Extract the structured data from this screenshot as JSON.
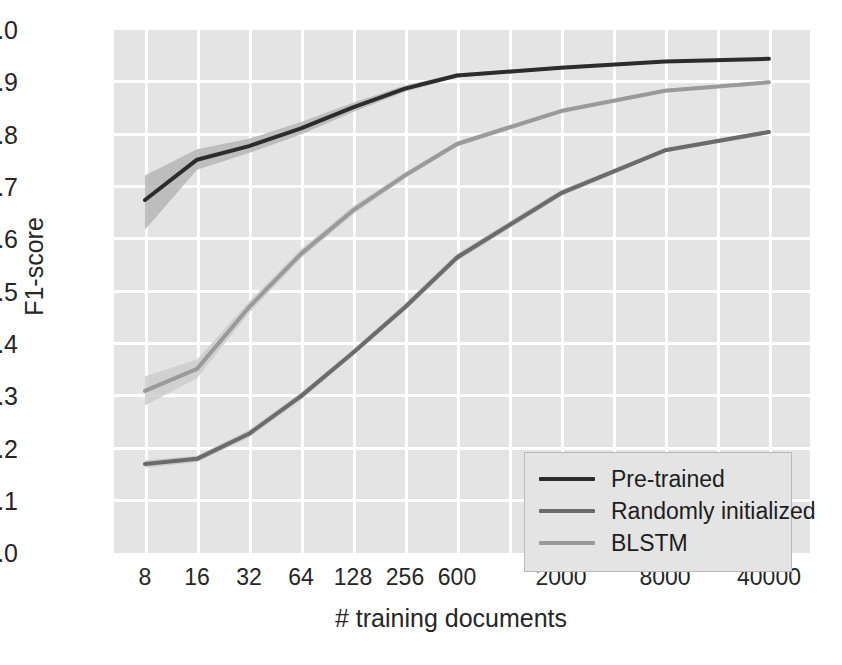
{
  "chart_data": {
    "type": "line",
    "title": "",
    "xlabel": "# training documents",
    "ylabel": "F1-score",
    "categories": [
      "8",
      "16",
      "32",
      "64",
      "128",
      "256",
      "600",
      "2000",
      "8000",
      "40000"
    ],
    "ylim": [
      0.0,
      1.0
    ],
    "yticks": [
      "1.0",
      "0.9",
      "0.8",
      "0.7",
      "0.6",
      "0.5",
      "0.4",
      "0.3",
      "0.2",
      "0.1",
      "0.0"
    ],
    "grid": true,
    "legend_position": "lower right",
    "series": [
      {
        "name": "Pre-trained",
        "color": "#2c2c2c",
        "band_color": "#b6b6b6",
        "values": [
          0.675,
          0.752,
          0.778,
          0.812,
          0.852,
          0.888,
          0.913,
          0.928,
          0.94,
          0.945
        ],
        "band_lower": [
          0.618,
          0.733,
          0.765,
          0.8,
          0.843,
          0.882,
          0.909,
          0.925,
          0.938,
          0.943
        ],
        "band_upper": [
          0.722,
          0.772,
          0.792,
          0.824,
          0.861,
          0.894,
          0.917,
          0.931,
          0.942,
          0.947
        ]
      },
      {
        "name": "Randomly initialized",
        "color": "#6b6b6b",
        "band_color": "#c4c4c4",
        "values": [
          0.17,
          0.18,
          0.228,
          0.3,
          0.383,
          0.47,
          0.565,
          0.688,
          0.77,
          0.805
        ],
        "band_lower": [
          0.163,
          0.174,
          0.221,
          0.293,
          0.377,
          0.463,
          0.558,
          0.682,
          0.766,
          0.801
        ],
        "band_upper": [
          0.177,
          0.186,
          0.235,
          0.307,
          0.389,
          0.477,
          0.572,
          0.694,
          0.774,
          0.809
        ]
      },
      {
        "name": "BLSTM",
        "color": "#9a9a9a",
        "band_color": "#cdcdcd",
        "values": [
          0.31,
          0.352,
          0.47,
          0.572,
          0.655,
          0.722,
          0.782,
          0.845,
          0.884,
          0.9
        ],
        "band_lower": [
          0.282,
          0.334,
          0.459,
          0.563,
          0.647,
          0.716,
          0.777,
          0.841,
          0.881,
          0.897
        ],
        "band_upper": [
          0.338,
          0.37,
          0.481,
          0.581,
          0.663,
          0.728,
          0.787,
          0.849,
          0.887,
          0.903
        ]
      }
    ],
    "x_pixel_fractions": [
      0.0445,
      0.1193,
      0.194,
      0.2687,
      0.3434,
      0.4181,
      0.4928,
      0.6422,
      0.7916,
      0.941
    ]
  },
  "legend": {
    "items": [
      {
        "label": "Pre-trained"
      },
      {
        "label": "Randomly initialized"
      },
      {
        "label": "BLSTM"
      }
    ]
  }
}
